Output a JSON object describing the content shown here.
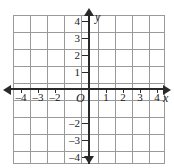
{
  "figure": {
    "background_color": "#ffffff",
    "grid_color": "#9a9a9a",
    "axis_color": "#2a2a2a",
    "text_color": "#1a1a1a"
  },
  "chart_data": {
    "type": "scatter",
    "title": "",
    "xlabel": "x",
    "ylabel": "y",
    "origin_label": "O",
    "xlim": [
      -4.5,
      4.5
    ],
    "ylim": [
      -4.5,
      4.5
    ],
    "grid": true,
    "grid_spacing": 1,
    "series": [
      {
        "name": "",
        "x": [],
        "y": []
      }
    ],
    "x_tick_values": [
      -4,
      -3,
      -2,
      1,
      2,
      3,
      4
    ],
    "x_tick_labels": [
      "–4",
      "–3",
      "–2",
      "1",
      "2",
      "3",
      "4"
    ],
    "y_tick_values": [
      4,
      3,
      2,
      1,
      -2,
      -3,
      -4
    ],
    "y_tick_labels": [
      "4",
      "3",
      "2",
      "1",
      "–2",
      "–3",
      "–4"
    ],
    "legend": null,
    "annotations": []
  },
  "axes": {
    "x_axis": {
      "name": "x",
      "arrow_left": true,
      "arrow_right": true,
      "ticks": [
        {
          "value": -4,
          "label": "–4",
          "px": 21
        },
        {
          "value": -3,
          "label": "–3",
          "px": 38
        },
        {
          "value": -2,
          "label": "–2",
          "px": 55
        },
        {
          "value": 1,
          "label": "1",
          "px": 106
        },
        {
          "value": 2,
          "label": "2",
          "px": 123
        },
        {
          "value": 3,
          "label": "3",
          "px": 140
        },
        {
          "value": 4,
          "label": "4",
          "px": 157
        }
      ]
    },
    "y_axis": {
      "name": "y",
      "arrow_up": true,
      "arrow_down": true,
      "ticks": [
        {
          "value": 4,
          "label": "4",
          "px": 21
        },
        {
          "value": 3,
          "label": "3",
          "px": 38
        },
        {
          "value": 2,
          "label": "2",
          "px": 55
        },
        {
          "value": 1,
          "label": "1",
          "px": 72
        },
        {
          "value": -2,
          "label": "–2",
          "px": 123
        },
        {
          "value": -3,
          "label": "–3",
          "px": 140
        },
        {
          "value": -4,
          "label": "–4",
          "px": 157
        }
      ]
    },
    "origin": {
      "label": "O"
    }
  },
  "grid_lines": {
    "vertical_px": [
      0,
      17,
      34,
      51,
      68,
      85,
      102,
      119,
      136,
      151
    ],
    "horizontal_px": [
      0,
      17,
      34,
      51,
      68,
      85,
      102,
      119,
      136,
      148
    ]
  }
}
